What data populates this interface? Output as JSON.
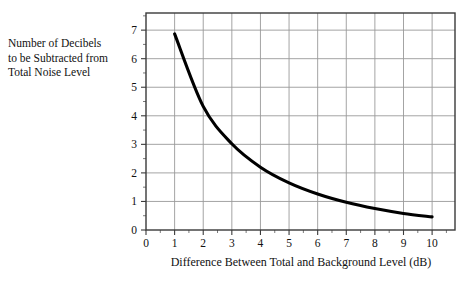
{
  "chart_data": {
    "type": "line",
    "title": "",
    "xlabel": "Difference Between Total and Background Level (dB)",
    "ylabel": "Number of Decibels to be Subtracted from Total Noise Level",
    "ylabel_lines": [
      "Number of Decibels",
      "to be Subtracted from",
      "Total Noise Level"
    ],
    "x": [
      1,
      2,
      3,
      4,
      5,
      6,
      7,
      8,
      9,
      10
    ],
    "values": [
      6.87,
      4.33,
      3.02,
      2.2,
      1.65,
      1.26,
      0.97,
      0.75,
      0.58,
      0.46
    ],
    "series": [
      {
        "name": "Decibel correction",
        "values": [
          6.87,
          4.33,
          3.02,
          2.2,
          1.65,
          1.26,
          0.97,
          0.75,
          0.58,
          0.46
        ]
      }
    ],
    "xlim": [
      0,
      10.8
    ],
    "ylim": [
      0,
      7.6
    ],
    "xticks": [
      0,
      1,
      2,
      3,
      4,
      5,
      6,
      7,
      8,
      9,
      10
    ],
    "yticks": [
      0,
      1,
      2,
      3,
      4,
      5,
      6,
      7
    ],
    "xticklabels": [
      "0",
      "1",
      "2",
      "3",
      "4",
      "5",
      "6",
      "7",
      "8",
      "9",
      "10"
    ],
    "yticklabels": [
      "0",
      "1",
      "2",
      "3",
      "4",
      "5",
      "6",
      "7"
    ],
    "x_minor_step": 0.5,
    "y_minor_step": 0.5,
    "grid": true,
    "grid_color": "#9a9a9a",
    "line_color": "#000000",
    "frame_color": "#3a3a3a",
    "background": "#ffffff",
    "legend": "none"
  }
}
